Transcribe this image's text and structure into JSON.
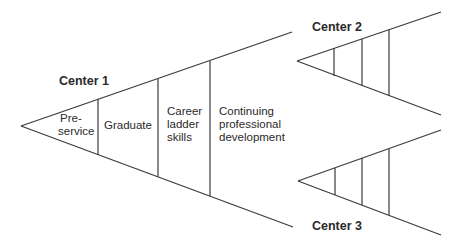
{
  "diagram": {
    "line_color": "#3a3a3a",
    "centers": [
      {
        "label": "Center 1",
        "apex": [
          21,
          126
        ],
        "upper_end": [
          292,
          32
        ],
        "lower_end": [
          293,
          227
        ],
        "dividers_x": [
          98,
          158,
          210
        ],
        "segments": [
          "Pre-\nservice",
          "Graduate",
          "Career\nladder\nskills",
          "Continuing\nprofessional\ndevelopment"
        ]
      },
      {
        "label": "Center 2",
        "apex": [
          297,
          61
        ],
        "upper_end": [
          441,
          12
        ],
        "lower_end": [
          441,
          115
        ],
        "dividers_x": [
          334,
          362,
          389
        ]
      },
      {
        "label": "Center 3",
        "apex": [
          298,
          181
        ],
        "upper_end": [
          441,
          130
        ],
        "lower_end": [
          441,
          235
        ],
        "dividers_x": [
          335,
          362,
          389
        ]
      }
    ],
    "labels": {
      "center1": "Center 1",
      "center2": "Center 2",
      "center3": "Center 3",
      "seg_preservice_1": "Pre-",
      "seg_preservice_2": "service",
      "seg_graduate": "Graduate",
      "seg_career_1": "Career",
      "seg_career_2": "ladder",
      "seg_career_3": "skills",
      "seg_continuing_1": "Continuing",
      "seg_continuing_2": "professional",
      "seg_continuing_3": "development"
    }
  }
}
